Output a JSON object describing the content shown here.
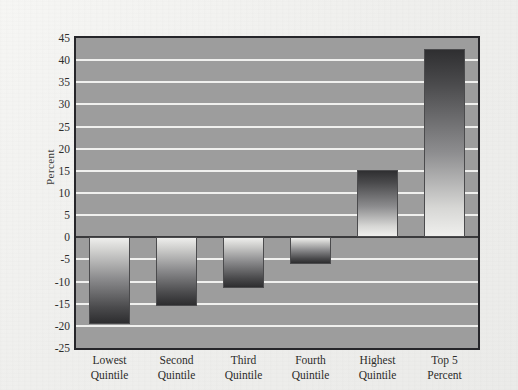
{
  "figure": {
    "background_color": "#f2f2f0",
    "plot_background_color": "#9d9d9d",
    "gridline_color": "#f4f4f2",
    "axis_color": "#26262a"
  },
  "chart_data": {
    "type": "bar",
    "title": "",
    "subtitle": "",
    "xlabel": "",
    "ylabel": "Percent",
    "categories": [
      "Lowest Quintile",
      "Second Quintile",
      "Third Quintile",
      "Fourth Quintile",
      "Highest Quintile",
      "Top 5 Percent"
    ],
    "category_lines": [
      [
        "Lowest",
        "Quintile"
      ],
      [
        "Second",
        "Quintile"
      ],
      [
        "Third",
        "Quintile"
      ],
      [
        "Fourth",
        "Quintile"
      ],
      [
        "Highest",
        "Quintile"
      ],
      [
        "Top 5",
        "Percent"
      ]
    ],
    "values": [
      -19.5,
      -15.5,
      -11.5,
      -6.0,
      15.3,
      42.5
    ],
    "ylim": [
      -25,
      45
    ],
    "ytick_values": [
      45,
      40,
      35,
      30,
      25,
      20,
      15,
      10,
      5,
      0,
      -5,
      -10,
      -15,
      -20,
      -25
    ],
    "ytick_labels": [
      "45",
      "40",
      "35",
      "30",
      "25",
      "20",
      "15",
      "10",
      "5",
      "0",
      "-5",
      "-10",
      "-15",
      "-20",
      "-25"
    ],
    "grid": true,
    "grid_axis": "y",
    "legend": false,
    "legend_position": "none",
    "bar_fill": "vertical-gradient",
    "zero_line": true
  }
}
